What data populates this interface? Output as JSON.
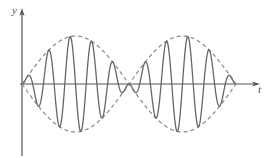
{
  "figure": {
    "type": "beat-wave-diagram",
    "labels": {
      "y_axis": "y",
      "x_axis": "t"
    },
    "colors": {
      "axis": "#555555",
      "wave": "#666666",
      "envelope": "#888888"
    },
    "origin": {
      "x": 22,
      "y": 84
    },
    "envelope": {
      "amplitude": 48,
      "node_spacing": 107,
      "lobes": 2
    },
    "carrier": {
      "cycles_per_lobe": 5
    }
  }
}
